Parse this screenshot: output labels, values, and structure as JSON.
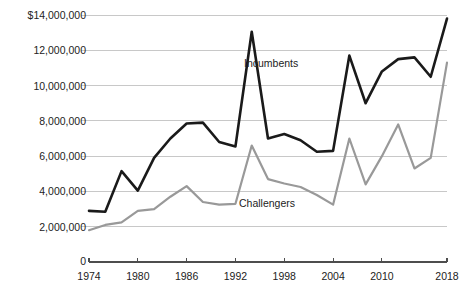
{
  "chart_data": {
    "type": "line",
    "title": "",
    "subtitle": "",
    "xlabel": "",
    "ylabel": "",
    "x": [
      1974,
      1976,
      1978,
      1980,
      1982,
      1984,
      1986,
      1988,
      1990,
      1992,
      1994,
      1996,
      1998,
      2000,
      2002,
      2004,
      2006,
      2008,
      2010,
      2012,
      2014,
      2016,
      2018
    ],
    "xlim": [
      1974,
      2018
    ],
    "ylim": [
      0,
      14000000
    ],
    "grid": true,
    "legend_position": "inline-annotation",
    "y_ticks": [
      2000000,
      4000000,
      6000000,
      8000000,
      10000000,
      12000000,
      14000000
    ],
    "y_tick_labels": [
      "2,000,000",
      "4,000,000",
      "6,000,000",
      "8,000,000",
      "10,000,000",
      "12,000,000",
      "$14,000,000"
    ],
    "y_axis_origin_label": "0",
    "x_ticks": [
      1974,
      1980,
      1986,
      1992,
      1998,
      2004,
      2010,
      2018
    ],
    "x_tick_labels": [
      "1974",
      "1980",
      "1986",
      "1992",
      "1998",
      "2004",
      "2010",
      "2018"
    ],
    "series": [
      {
        "name": "Incumbents",
        "color": "#1a1a1a",
        "width": 2.6,
        "values": [
          2900000,
          2850000,
          5150000,
          4050000,
          5900000,
          7000000,
          7850000,
          7900000,
          6800000,
          6550000,
          13050000,
          7000000,
          7250000,
          6900000,
          6250000,
          6300000,
          11700000,
          9000000,
          10800000,
          11500000,
          11600000,
          10500000,
          13800000
        ]
      },
      {
        "name": "Challengers",
        "color": "#999999",
        "width": 2.2,
        "values": [
          1800000,
          2100000,
          2250000,
          2900000,
          3000000,
          3700000,
          4300000,
          3400000,
          3250000,
          3300000,
          6600000,
          4700000,
          4450000,
          4250000,
          3800000,
          3250000,
          7000000,
          4400000,
          6000000,
          7800000,
          5300000,
          5900000,
          11300000
        ]
      }
    ],
    "annotations": [
      {
        "text": "Incumbents",
        "x_px": 244,
        "y_px": 57
      },
      {
        "text": "Challengers",
        "x_px": 239,
        "y_px": 197
      }
    ],
    "colors": {
      "incumbents": "#1a1a1a",
      "challengers": "#999999",
      "gridline": "#c8c8c8",
      "axis": "#4d4d4d",
      "text": "#222222",
      "background": "#ffffff"
    }
  }
}
